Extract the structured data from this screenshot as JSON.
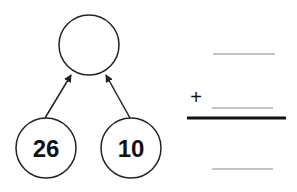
{
  "diagram": {
    "type": "number-bond",
    "whole": {
      "value": ""
    },
    "parts": [
      {
        "value": "26"
      },
      {
        "value": "10"
      }
    ]
  },
  "equation": {
    "operator": "+",
    "addend_1": "",
    "addend_2": "",
    "sum": ""
  },
  "colors": {
    "stroke": "#222222",
    "blank_line": "#888888",
    "text": "#111111"
  }
}
